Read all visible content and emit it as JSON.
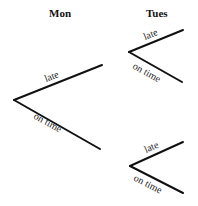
{
  "headings": {
    "day1": "Mon",
    "day2": "Tues"
  },
  "tree": {
    "mon": {
      "late_label": "late",
      "on_time_label": "on time"
    },
    "tues_after_late": {
      "late_label": "late",
      "on_time_label": "on time"
    },
    "tues_after_on_time": {
      "late_label": "late",
      "on_time_label": "on time"
    }
  },
  "colors": {
    "line": "#111111",
    "text": "#222222"
  }
}
